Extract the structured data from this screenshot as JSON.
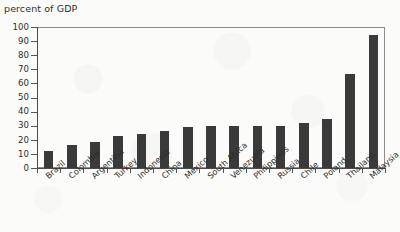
{
  "chart_data": {
    "type": "bar",
    "title": "percent of GDP",
    "xlabel": "",
    "ylabel": "percent of GDP",
    "ylim": [
      0,
      100
    ],
    "yticks": [
      0,
      10,
      20,
      30,
      40,
      50,
      60,
      70,
      80,
      90,
      100
    ],
    "grid": false,
    "legend": null,
    "bar_color": "#3a3a3a",
    "categories": [
      "Brazil",
      "Colombia",
      "Argentina",
      "Turkey",
      "Indonesia",
      "China",
      "Mexico",
      "South Africa",
      "Venezuela",
      "Philippines",
      "Russia",
      "Chile",
      "Poland",
      "Thailand",
      "Malaysia"
    ],
    "values": [
      12,
      16.5,
      18.5,
      22.5,
      24,
      26,
      29,
      29.5,
      29.5,
      29.5,
      30,
      32,
      35,
      67,
      94
    ]
  },
  "axis": {
    "y_tick_labels": [
      "100",
      "90",
      "80",
      "70",
      "60",
      "50",
      "40",
      "30",
      "20",
      "10",
      "0"
    ]
  }
}
